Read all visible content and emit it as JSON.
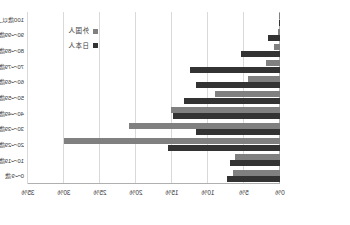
{
  "chart_data": {
    "type": "bar",
    "orientation": "horizontal",
    "title": "",
    "subtitle": "",
    "xlabel": "",
    "ylabel": "",
    "xlim": [
      0,
      35
    ],
    "xtick_labels": [
      "0%",
      "5%",
      "10%",
      "15%",
      "20%",
      "25%",
      "30%",
      "35%"
    ],
    "xtick_values": [
      0,
      5,
      10,
      15,
      20,
      25,
      30,
      35
    ],
    "grid": true,
    "axis_direction": "right-to-left",
    "mirrored": true,
    "legend_position": "upper-left",
    "categories": [
      "100歳以上",
      "90～99歳",
      "80～89歳",
      "70～79歳",
      "60～69歳",
      "50～59歳",
      "40～49歳",
      "30～39歳",
      "20～29歳",
      "10～19歳",
      "0～9歳"
    ],
    "series": [
      {
        "name": "日本人",
        "color": "#333333",
        "values": [
          0.05,
          1.6,
          5.4,
          12.5,
          11.6,
          13.4,
          14.9,
          11.7,
          15.5,
          6.9,
          7.4
        ]
      },
      {
        "name": "外国人",
        "color": "#808080",
        "values": [
          0.02,
          0.3,
          0.9,
          2.0,
          4.4,
          9.0,
          15.2,
          21.0,
          30.0,
          6.3,
          6.5
        ]
      }
    ]
  },
  "legend": {
    "entries": [
      {
        "label": "外国人",
        "color": "#808080"
      },
      {
        "label": "日本人",
        "color": "#333333"
      }
    ]
  },
  "colors": {
    "series_japanese": "#333333",
    "series_foreign": "#808080",
    "gridline": "#d9d9d9",
    "axis": "#b0b0b0",
    "text": "#3a3a3a",
    "background": "#ffffff"
  }
}
